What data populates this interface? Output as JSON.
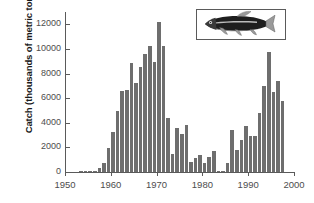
{
  "chart_data": {
    "type": "bar",
    "title": "",
    "xlabel": "",
    "ylabel": "Catch (thousands of metric tons)",
    "xlim": [
      1950,
      2000
    ],
    "ylim": [
      0,
      13000
    ],
    "grid": false,
    "legend": null,
    "bar_color": "#6e6e6e",
    "axis_color": "#5a5a5a",
    "xticks": [
      "1950",
      "1960",
      "1970",
      "1980",
      "1990",
      "2000"
    ],
    "xtick_values": [
      1950,
      1960,
      1970,
      1980,
      1990,
      2000
    ],
    "yticks": [
      "0",
      "2000",
      "4000",
      "6000",
      "8000",
      "10000",
      "12000"
    ],
    "ytick_values": [
      0,
      2000,
      4000,
      6000,
      8000,
      10000,
      12000
    ],
    "x": [
      1950,
      1951,
      1952,
      1953,
      1954,
      1955,
      1956,
      1957,
      1958,
      1959,
      1960,
      1961,
      1962,
      1963,
      1964,
      1965,
      1966,
      1967,
      1968,
      1969,
      1970,
      1971,
      1972,
      1973,
      1974,
      1975,
      1976,
      1977,
      1978,
      1979,
      1980,
      1981,
      1982,
      1983,
      1984,
      1985,
      1986,
      1987,
      1988,
      1989,
      1990,
      1991,
      1992,
      1993,
      1994,
      1995,
      1996,
      1997
    ],
    "values": [
      0,
      0,
      0,
      25,
      40,
      60,
      120,
      300,
      700,
      1970,
      3250,
      4950,
      6620,
      6640,
      8860,
      7200,
      8500,
      9600,
      10200,
      8900,
      12200,
      10200,
      4350,
      1450,
      3550,
      3100,
      3850,
      800,
      1150,
      1350,
      720,
      1180,
      1700,
      120,
      20,
      720,
      3450,
      1750,
      2640,
      3700,
      2900,
      2950,
      4800,
      6950,
      9750,
      6500,
      7400,
      5800
    ],
    "series_name": "Peruvian anchoveta catch"
  },
  "inset": {
    "name": "fish-illustration",
    "description": "anchoveta fish"
  }
}
